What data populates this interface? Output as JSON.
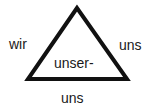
{
  "diagram": {
    "shape": "triangle",
    "stroke_color": "#111111",
    "fill_color": "#ffffff",
    "labels": {
      "left": "wir",
      "right": "uns",
      "center": "unser-",
      "bottom": "uns"
    }
  }
}
